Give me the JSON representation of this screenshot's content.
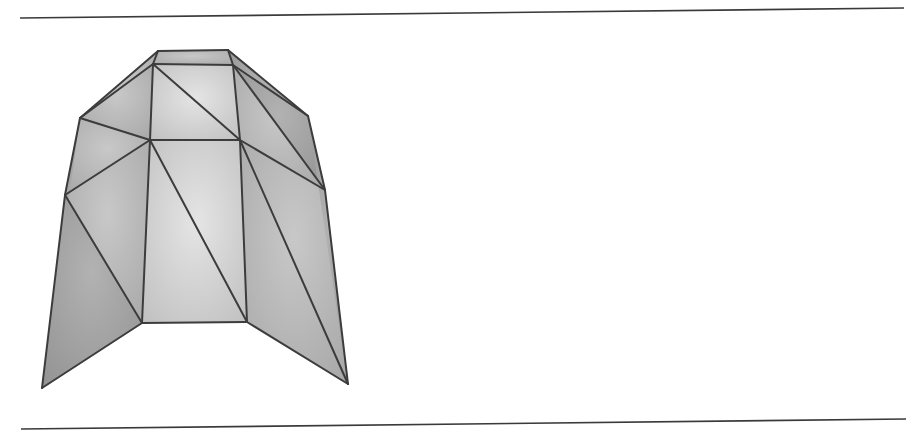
{
  "figure": {
    "colors": {
      "background": "#ffffff",
      "rule": "#3a3a3a",
      "edge": "#3c3c3c",
      "face_light": "#d6d6d6",
      "face_mid": "#b4b4b4",
      "face_dark": "#9c9c9c"
    },
    "rules": [
      {
        "name": "top-rule",
        "x1": 20,
        "y1": 18,
        "x2": 508,
        "y2": 8
      },
      {
        "name": "bottom-rule",
        "x1": 21,
        "y1": 429,
        "x2": 511,
        "y2": 419
      }
    ],
    "vertices": {
      "TL": [
        158,
        51
      ],
      "TR": [
        228,
        50
      ],
      "IL": [
        153,
        64
      ],
      "IR": [
        233,
        65
      ],
      "SL": [
        80,
        118
      ],
      "SR": [
        308,
        116
      ],
      "ML": [
        150,
        140
      ],
      "MR": [
        240,
        140
      ],
      "L2": [
        65,
        195
      ],
      "R2": [
        325,
        190
      ],
      "BL": [
        142,
        323
      ],
      "BR": [
        247,
        322
      ],
      "FL": [
        42,
        388
      ],
      "FR": [
        348,
        384
      ]
    },
    "faces": [
      {
        "v": [
          "TL",
          "TR",
          "IR",
          "IL"
        ],
        "shade": "face_mid"
      },
      {
        "v": [
          "TL",
          "IL",
          "SL"
        ],
        "shade": "face_mid"
      },
      {
        "v": [
          "TR",
          "SR",
          "IR"
        ],
        "shade": "face_dark"
      },
      {
        "v": [
          "IL",
          "IR",
          "MR"
        ],
        "shade": "face_light"
      },
      {
        "v": [
          "IL",
          "MR",
          "ML"
        ],
        "shade": "face_light"
      },
      {
        "v": [
          "IL",
          "ML",
          "SL"
        ],
        "shade": "face_mid"
      },
      {
        "v": [
          "IR",
          "SR",
          "R2"
        ],
        "shade": "face_dark"
      },
      {
        "v": [
          "IR",
          "R2",
          "MR"
        ],
        "shade": "face_mid"
      },
      {
        "v": [
          "SL",
          "ML",
          "L2"
        ],
        "shade": "face_mid"
      },
      {
        "v": [
          "ML",
          "MR",
          "BR"
        ],
        "shade": "face_light"
      },
      {
        "v": [
          "ML",
          "BR",
          "BL"
        ],
        "shade": "face_light"
      },
      {
        "v": [
          "L2",
          "ML",
          "BL"
        ],
        "shade": "face_mid"
      },
      {
        "v": [
          "SL",
          "L2",
          "FL"
        ],
        "shade": "face_dark"
      },
      {
        "v": [
          "L2",
          "BL",
          "FL"
        ],
        "shade": "face_dark"
      },
      {
        "v": [
          "MR",
          "R2",
          "FR"
        ],
        "shade": "face_mid"
      },
      {
        "v": [
          "MR",
          "FR",
          "BR"
        ],
        "shade": "face_mid"
      },
      {
        "v": [
          "SR",
          "R2",
          "FR"
        ],
        "shade": "face_dark"
      }
    ],
    "edges": [
      [
        "TL",
        "TR"
      ],
      [
        "TL",
        "IL"
      ],
      [
        "TR",
        "IR"
      ],
      [
        "IL",
        "IR"
      ],
      [
        "TL",
        "SL"
      ],
      [
        "TR",
        "SR"
      ],
      [
        "IL",
        "SL"
      ],
      [
        "IR",
        "SR"
      ],
      [
        "IL",
        "ML"
      ],
      [
        "IL",
        "MR"
      ],
      [
        "IR",
        "MR"
      ],
      [
        "IR",
        "R2"
      ],
      [
        "SL",
        "ML"
      ],
      [
        "ML",
        "MR"
      ],
      [
        "MR",
        "R2"
      ],
      [
        "SR",
        "R2"
      ],
      [
        "SL",
        "L2"
      ],
      [
        "L2",
        "ML"
      ],
      [
        "L2",
        "BL"
      ],
      [
        "L2",
        "FL"
      ],
      [
        "ML",
        "BL"
      ],
      [
        "ML",
        "BR"
      ],
      [
        "MR",
        "BR"
      ],
      [
        "MR",
        "FR"
      ],
      [
        "R2",
        "FR"
      ],
      [
        "BL",
        "BR"
      ],
      [
        "BL",
        "FL"
      ],
      [
        "BR",
        "FR"
      ]
    ]
  }
}
